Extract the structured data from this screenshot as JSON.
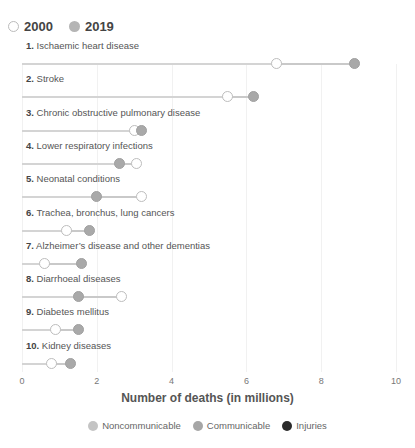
{
  "year_legend": [
    {
      "label": "2000",
      "style": "open"
    },
    {
      "label": "2019",
      "style": "filled"
    }
  ],
  "rows": [
    {
      "rank": "1.",
      "name": "Ischaemic heart disease",
      "v2000": 6.8,
      "v2019": 8.9
    },
    {
      "rank": "2.",
      "name": "Stroke",
      "v2000": 5.5,
      "v2019": 6.2
    },
    {
      "rank": "3.",
      "name": "Chronic obstructive pulmonary disease",
      "v2000": 3.0,
      "v2019": 3.2
    },
    {
      "rank": "4.",
      "name": "Lower respiratory infections",
      "v2000": 3.05,
      "v2019": 2.6
    },
    {
      "rank": "5.",
      "name": "Neonatal conditions",
      "v2000": 3.2,
      "v2019": 2.0
    },
    {
      "rank": "6.",
      "name": "Trachea, bronchus, lung cancers",
      "v2000": 1.2,
      "v2019": 1.8
    },
    {
      "rank": "7.",
      "name": "Alzheimer’s disease and other dementias",
      "v2000": 0.6,
      "v2019": 1.6
    },
    {
      "rank": "8.",
      "name": "Diarrhoeal diseases",
      "v2000": 2.65,
      "v2019": 1.5
    },
    {
      "rank": "9.",
      "name": "Diabetes mellitus",
      "v2000": 0.9,
      "v2019": 1.5
    },
    {
      "rank": "10.",
      "name": "Kidney diseases",
      "v2000": 0.8,
      "v2019": 1.3
    }
  ],
  "x_ticks": [
    "0",
    "2",
    "4",
    "6",
    "8",
    "10"
  ],
  "x_label": "Number of deaths (in millions)",
  "category_legend": [
    {
      "label": "Noncommunicable",
      "color": "#c4c4c4"
    },
    {
      "label": "Communicable",
      "color": "#a6a6a6"
    },
    {
      "label": "Injuries",
      "color": "#2b2b2b"
    }
  ],
  "chart_data": {
    "type": "dumbbell",
    "title": "",
    "xlabel": "Number of deaths (in millions)",
    "ylabel": "",
    "xlim": [
      0,
      10
    ],
    "x_ticks": [
      0,
      2,
      4,
      6,
      8,
      10
    ],
    "grid": true,
    "legend_position": "top (years) / bottom (categories)",
    "categories": [
      "Ischaemic heart disease",
      "Stroke",
      "Chronic obstructive pulmonary disease",
      "Lower respiratory infections",
      "Neonatal conditions",
      "Trachea, bronchus, lung cancers",
      "Alzheimer’s disease and other dementias",
      "Diarrhoeal diseases",
      "Diabetes mellitus",
      "Kidney diseases"
    ],
    "series": [
      {
        "name": "2000",
        "values": [
          6.8,
          5.5,
          3.0,
          3.05,
          3.2,
          1.2,
          0.6,
          2.65,
          0.9,
          0.8
        ]
      },
      {
        "name": "2019",
        "values": [
          8.9,
          6.2,
          3.2,
          2.6,
          2.0,
          1.8,
          1.6,
          1.5,
          1.5,
          1.3
        ]
      }
    ],
    "category_groups": [
      "Noncommunicable",
      "Communicable",
      "Injuries"
    ]
  }
}
